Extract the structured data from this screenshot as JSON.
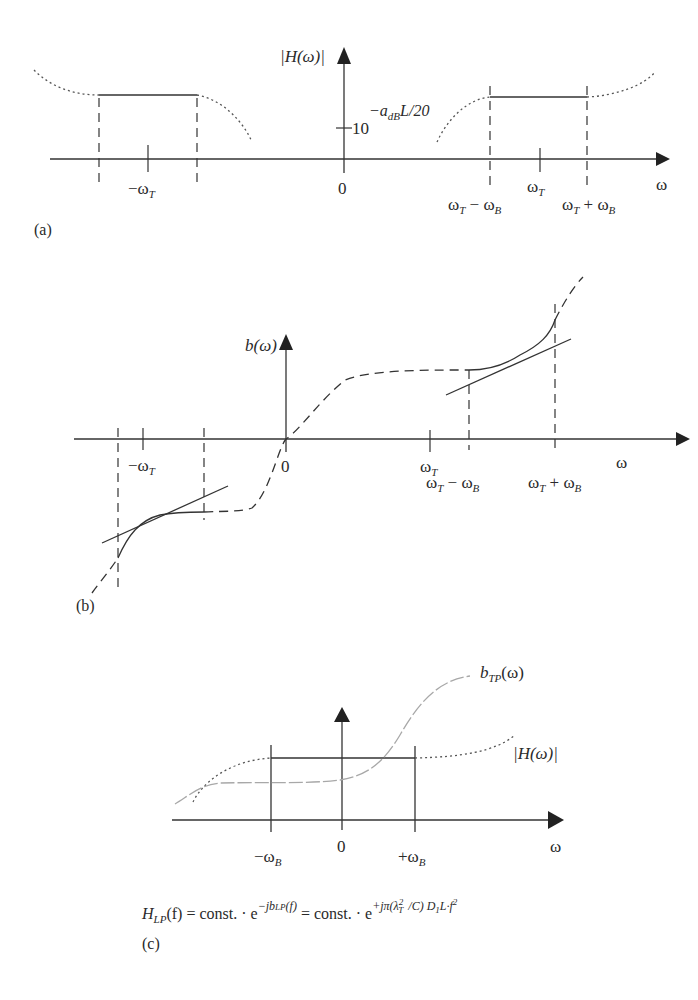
{
  "figure": {
    "panels": [
      {
        "id": "a",
        "label": "(a)",
        "y_axis_label": "|H(ω)|",
        "y_tick_label_base": "10",
        "y_tick_label_exponent": "−a",
        "y_tick_label_exponent_sub": "dB",
        "y_tick_label_exponent_tail": "L/20",
        "x_axis_label": "ω",
        "x_ticks": {
          "neg_wt": "−ω",
          "neg_wt_sub": "T",
          "zero": "0",
          "wt_minus_wb_a": "ω",
          "wt_minus_wb_sub1": "T",
          "wt_minus_wb_mid": " − ω",
          "wt_minus_wb_sub2": "B",
          "wt": "ω",
          "wt_sub": "T",
          "wt_plus_wb_a": "ω",
          "wt_plus_wb_sub1": "T",
          "wt_plus_wb_mid": " + ω",
          "wt_plus_wb_sub2": "B"
        }
      },
      {
        "id": "b",
        "label": "(b)",
        "y_axis_label": "b(ω)",
        "x_axis_label": "ω",
        "x_ticks": {
          "neg_wt": "−ω",
          "neg_wt_sub": "T",
          "zero": "0",
          "wt_minus_wb_a": "ω",
          "wt_minus_wb_sub1": "T",
          "wt_minus_wb_mid": " − ω",
          "wt_minus_wb_sub2": "B",
          "wt": "ω",
          "wt_sub": "T",
          "wt_plus_wb_a": "ω",
          "wt_plus_wb_sub1": "T",
          "wt_plus_wb_mid": " + ω",
          "wt_plus_wb_sub2": "B"
        }
      },
      {
        "id": "c",
        "label": "(c)",
        "x_axis_label": "ω",
        "curve_labels": {
          "phase_a": "b",
          "phase_sub": "TP",
          "phase_tail": "(ω)",
          "magnitude": "|H(ω)|"
        },
        "x_ticks": {
          "neg_wb": "−ω",
          "neg_wb_sub": "B",
          "zero": "0",
          "pos_wb": "+ω",
          "pos_wb_sub": "B"
        },
        "equation": {
          "lhs_a": "H",
          "lhs_sub": "LP",
          "lhs_tail": "(f) = const. · e",
          "exp1": "−jb",
          "exp1_sub": "LP",
          "exp1_tail": "(f)",
          "mid": " = const. · e",
          "exp2": "+jπ(λ",
          "exp2_sup": "2",
          "exp2_sub": "T",
          "exp2_tail": "/C) D",
          "exp2_sub2": "1",
          "exp2_tail2": "L·f",
          "exp2_sup2": "2"
        }
      }
    ],
    "colors": {
      "ink": "#2a2a2a",
      "light_curve": "#a8a8a8",
      "dotted": "#555555"
    }
  }
}
